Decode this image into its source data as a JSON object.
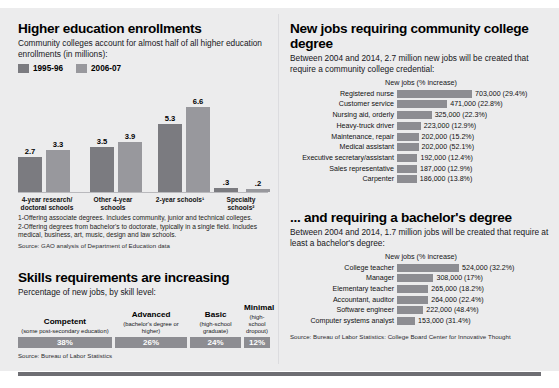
{
  "left": {
    "title": "Higher education enrollments",
    "subtitle": "Community colleges account for almost half of all higher education enrollments (in millions):",
    "legend": [
      {
        "label": "1995-96",
        "color": "#7b7b80"
      },
      {
        "label": "2006-07",
        "color": "#98989d"
      }
    ],
    "chart_data": {
      "type": "bar",
      "title": "Higher education enrollments",
      "ylabel": "Enrollments (in millions)",
      "xlabel": "",
      "ylim": [
        0,
        7
      ],
      "grid": false,
      "legend_position": "top-left",
      "categories": [
        "4-year research/ doctoral schools",
        "Other 4-year schools",
        "2-year schools¹",
        "Specialty schools²"
      ],
      "series": [
        {
          "name": "1995-96",
          "values": [
            2.7,
            3.5,
            5.3,
            0.3
          ]
        },
        {
          "name": "2006-07",
          "values": [
            3.3,
            3.9,
            6.6,
            0.2
          ]
        }
      ],
      "value_labels": [
        [
          "2.7",
          "3.3"
        ],
        [
          "3.5",
          "3.9"
        ],
        [
          "5.3",
          "6.6"
        ],
        [
          ".3",
          ".2"
        ]
      ]
    },
    "axis_labels": [
      "4-year research/\ndoctoral schools",
      "Other 4-year\nschools",
      "2-year schools¹",
      "Specialty\nschools²"
    ],
    "footnotes": [
      "1-Offering associate degrees. Includes community, junior and technical colleges.",
      "2-Offering degrees from bachelor's to doctorate, typically in a single field. Includes medical, business, art, music, design and law schools."
    ],
    "source": "Source: GAO analysis of Department of Education data",
    "skills": {
      "title": "Skills requirements are increasing",
      "subtitle": "Percentage of new jobs, by skill level:",
      "source": "Source: Bureau of Labor Statistics",
      "chart_data": {
        "type": "bar",
        "title": "Skills requirements are increasing",
        "ylabel": "Percentage of new jobs",
        "categories": [
          "Competent",
          "Advanced",
          "Basic",
          "Minimal"
        ],
        "values": [
          38,
          26,
          24,
          12
        ],
        "value_labels": [
          "38%",
          "26%",
          "24%",
          "12%"
        ],
        "ylim": [
          0,
          100
        ]
      },
      "items": [
        {
          "name": "Competent",
          "qual": "(some post-secondary education)",
          "value": "38%",
          "pct": 38
        },
        {
          "name": "Advanced",
          "qual": "(bachelor's degree or higher)",
          "value": "26%",
          "pct": 26
        },
        {
          "name": "Basic",
          "qual": "(high-school graduate)",
          "value": "24%",
          "pct": 24
        },
        {
          "name": "Minimal",
          "qual": "(high-school dropout)",
          "value": "12%",
          "pct": 12
        }
      ]
    }
  },
  "right": {
    "top": {
      "title": "New jobs requiring community college degree",
      "subtitle": "Between 2004 and 2014, 2.7 million new jobs will be created that require a community college credential:",
      "column_header": "New jobs (% increase)",
      "chart_data": {
        "type": "bar",
        "orientation": "horizontal",
        "title": "New jobs requiring community college degree",
        "xlabel": "New jobs (% increase)",
        "categories": [
          "Registered nurse",
          "Customer service",
          "Nursing aid, orderly",
          "Heavy-truck driver",
          "Maintenance, repair",
          "Medical assistant",
          "Executive secretary/assistant",
          "Sales representative",
          "Carpenter"
        ],
        "values": [
          703000,
          471000,
          325000,
          223000,
          202000,
          202000,
          192000,
          187000,
          186000
        ],
        "pct_increase": [
          29.4,
          22.8,
          22.3,
          12.9,
          15.2,
          52.1,
          12.4,
          12.9,
          13.8
        ]
      },
      "rows": [
        {
          "name": "Registered nurse",
          "value": 703000,
          "label": "703,000 (29.4%)"
        },
        {
          "name": "Customer service",
          "value": 471000,
          "label": "471,000 (22.8%)"
        },
        {
          "name": "Nursing aid, orderly",
          "value": 325000,
          "label": "325,000 (22.3%)"
        },
        {
          "name": "Heavy-truck driver",
          "value": 223000,
          "label": "223,000 (12.9%)"
        },
        {
          "name": "Maintenance, repair",
          "value": 202000,
          "label": "202,000 (15.2%)"
        },
        {
          "name": "Medical assistant",
          "value": 202000,
          "label": "202,000 (52.1%)"
        },
        {
          "name": "Executive secretary/assistant",
          "value": 192000,
          "label": "192,000 (12.4%)"
        },
        {
          "name": "Sales representative",
          "value": 187000,
          "label": "187,000 (12.9%)"
        },
        {
          "name": "Carpenter",
          "value": 186000,
          "label": "186,000 (13.8%)"
        }
      ]
    },
    "bottom": {
      "title": "... and requiring a bachelor's degree",
      "subtitle": "Between 2004 and 2014, 1.7 million jobs will be created that require at least a bachelor's degree:",
      "column_header": "New jobs (% increase)",
      "chart_data": {
        "type": "bar",
        "orientation": "horizontal",
        "title": "... and requiring a bachelor's degree",
        "xlabel": "New jobs (% increase)",
        "categories": [
          "College teacher",
          "Manager",
          "Elementary teacher",
          "Accountant, auditor",
          "Software engineer",
          "Computer systems analyst"
        ],
        "values": [
          524000,
          308000,
          265000,
          264000,
          222000,
          153000
        ],
        "pct_increase": [
          32.2,
          17.0,
          18.2,
          22.4,
          48.4,
          31.4
        ]
      },
      "rows": [
        {
          "name": "College teacher",
          "value": 524000,
          "label": "524,000 (32.2%)"
        },
        {
          "name": "Manager",
          "value": 308000,
          "label": "308,000 (17%)"
        },
        {
          "name": "Elementary teacher",
          "value": 265000,
          "label": "265,000 (18.2%)"
        },
        {
          "name": "Accountant, auditor",
          "value": 264000,
          "label": "264,000 (22.4%)"
        },
        {
          "name": "Software engineer",
          "value": 222000,
          "label": "222,000 (48.4%)"
        },
        {
          "name": "Computer systems analyst",
          "value": 153000,
          "label": "153,000 (31.4%)"
        }
      ],
      "source": "Source: Bureau of Labor Statistics: College Board Center for Innovative Thought"
    }
  },
  "colors": {
    "bar_dark": "#7b7b80",
    "bar_light": "#98989d",
    "bar_mid": "#8d8d92",
    "panel_bg": "#ececed",
    "rule": "#6e6e73"
  }
}
